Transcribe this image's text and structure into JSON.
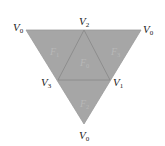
{
  "diagram": {
    "fill_color": "#a6a6a6",
    "edge_color": "#8a8a8a",
    "vertices": [
      {
        "id": "v0-top-left",
        "name": "V",
        "sub": "0",
        "x": 26,
        "y": 30,
        "lx": 13,
        "ly": 30
      },
      {
        "id": "v2-top",
        "name": "V",
        "sub": "2",
        "x": 84,
        "y": 30,
        "lx": 78,
        "ly": 24
      },
      {
        "id": "v0-top-right",
        "name": "V",
        "sub": "0",
        "x": 141,
        "y": 30,
        "lx": 143,
        "ly": 32
      },
      {
        "id": "v3-left",
        "name": "V",
        "sub": "3",
        "x": 58,
        "y": 80,
        "lx": 41,
        "ly": 86
      },
      {
        "id": "v1-right",
        "name": "V",
        "sub": "1",
        "x": 110,
        "y": 80,
        "lx": 113,
        "ly": 86
      },
      {
        "id": "v0-bottom",
        "name": "V",
        "sub": "0",
        "x": 84,
        "y": 124,
        "lx": 78,
        "ly": 139
      }
    ],
    "faces": [
      {
        "id": "f1",
        "name": "F",
        "sub": "1",
        "lx": 50,
        "ly": 52
      },
      {
        "id": "f0",
        "name": "F",
        "sub": "0",
        "lx": 80,
        "ly": 63
      },
      {
        "id": "f3",
        "name": "F",
        "sub": "3",
        "lx": 111,
        "ly": 52
      },
      {
        "id": "f2",
        "name": "F",
        "sub": "2",
        "lx": 80,
        "ly": 104
      }
    ]
  }
}
